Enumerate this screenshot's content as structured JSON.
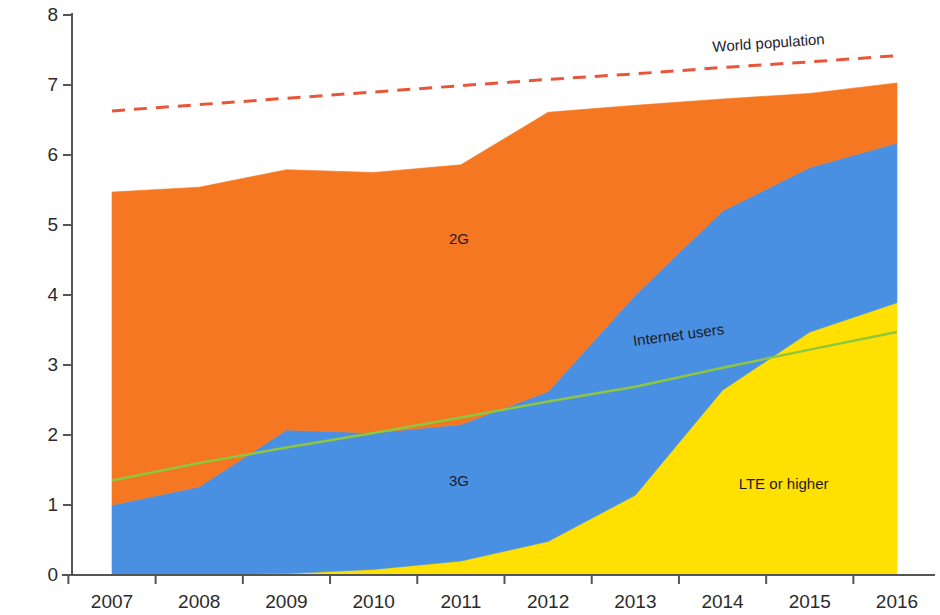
{
  "chart_data": {
    "type": "area",
    "title": "",
    "subtitle": "",
    "xlabel": "",
    "ylabel": "Billions of people",
    "x": [
      2007,
      2008,
      2009,
      2010,
      2011,
      2012,
      2013,
      2014,
      2015,
      2016
    ],
    "xtick_labels": [
      "2007",
      "2008",
      "2009",
      "2010",
      "2011",
      "2012",
      "2013",
      "2014",
      "2015",
      "2016"
    ],
    "ytick_labels": [
      "0",
      "1",
      "2",
      "3",
      "4",
      "5",
      "6",
      "7",
      "8"
    ],
    "yticks": [
      0,
      1,
      2,
      3,
      4,
      5,
      6,
      7,
      8
    ],
    "ylim": [
      0,
      8
    ],
    "xlim": [
      2007,
      2016
    ],
    "grid": false,
    "legend_position": "inline-annotations",
    "stacked": true,
    "series": [
      {
        "name": "LTE or higher",
        "color": "#ffe000",
        "kind": "stacked-area",
        "values": [
          0.0,
          0.0,
          0.02,
          0.08,
          0.2,
          0.48,
          1.14,
          2.64,
          3.47,
          3.89
        ]
      },
      {
        "name": "3G",
        "color": "#4a90e2",
        "kind": "stacked-area",
        "values": [
          1.0,
          1.26,
          2.05,
          1.95,
          1.95,
          2.14,
          2.86,
          2.56,
          2.35,
          2.28
        ]
      },
      {
        "name": "2G",
        "color": "#f57722",
        "kind": "stacked-area",
        "values": [
          4.47,
          4.28,
          3.72,
          3.72,
          3.71,
          3.99,
          2.71,
          1.6,
          1.06,
          0.86
        ]
      }
    ],
    "cumulative_totals": [
      5.47,
      5.54,
      5.79,
      5.75,
      5.86,
      6.61,
      6.71,
      6.8,
      6.88,
      7.03
    ],
    "lines": [
      {
        "name": "Internet users",
        "color": "#8dc63f",
        "style": "solid",
        "width": 2.5,
        "values": [
          1.35,
          1.6,
          1.82,
          2.03,
          2.25,
          2.48,
          2.69,
          2.96,
          3.22,
          3.47
        ]
      },
      {
        "name": "World population",
        "color": "#e8563a",
        "style": "dashed",
        "width": 3,
        "values": [
          6.63,
          6.72,
          6.81,
          6.9,
          6.99,
          7.08,
          7.16,
          7.25,
          7.33,
          7.42
        ]
      }
    ],
    "annotations": [
      {
        "text": "2G",
        "x": 2011,
        "y": 4.8
      },
      {
        "text": "3G",
        "x": 2011,
        "y": 1.35
      },
      {
        "text": "LTE or higher",
        "x": 2014.3,
        "y": 1.3
      },
      {
        "text": "Internet users",
        "x": 2013.1,
        "y": 3.35
      },
      {
        "text": "World population",
        "x": 2014.0,
        "y": 7.55
      }
    ]
  }
}
